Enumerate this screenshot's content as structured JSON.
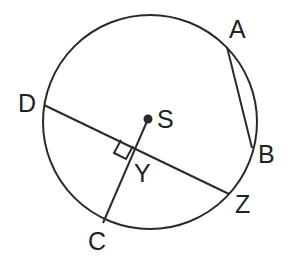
{
  "diagram": {
    "type": "circle-geometry",
    "center_label": "S",
    "points": {
      "A": "A",
      "B": "B",
      "C": "C",
      "D": "D",
      "Z": "Z",
      "S": "S",
      "Y": "Y"
    },
    "segments": [
      {
        "from": "A",
        "to": "B",
        "kind": "chord"
      },
      {
        "from": "D",
        "to": "Z",
        "kind": "chord"
      },
      {
        "from": "S",
        "to": "C",
        "kind": "segment"
      }
    ],
    "right_angle_at": "Y",
    "relation": "SC perpendicular to DZ at Y",
    "color": "#2a2a2a"
  }
}
